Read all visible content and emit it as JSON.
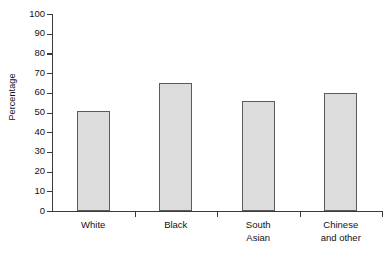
{
  "chart_data": {
    "type": "bar",
    "title": "",
    "xlabel": "",
    "ylabel": "Percentage",
    "categories": [
      "White",
      "Black",
      "South\nAsian",
      "Chinese\nand other"
    ],
    "values": [
      51,
      65,
      56,
      60
    ],
    "ylim": [
      0,
      100
    ],
    "yticks": [
      0,
      10,
      20,
      30,
      40,
      50,
      60,
      70,
      80,
      90,
      100
    ],
    "ytick_labels": [
      "0",
      "10",
      "20",
      "30",
      "40",
      "50",
      "60",
      "70",
      "80",
      "90",
      "100"
    ],
    "grid": false,
    "legend": null,
    "series": [
      {
        "name": "Percentage",
        "values": [
          51,
          65,
          56,
          60
        ]
      }
    ],
    "colors": {
      "bar_fill": "#dcdcdc",
      "bar_stroke": "#5b5b5b",
      "axis": "#3a3a3a",
      "text": "#111111",
      "background": "#ffffff"
    }
  }
}
